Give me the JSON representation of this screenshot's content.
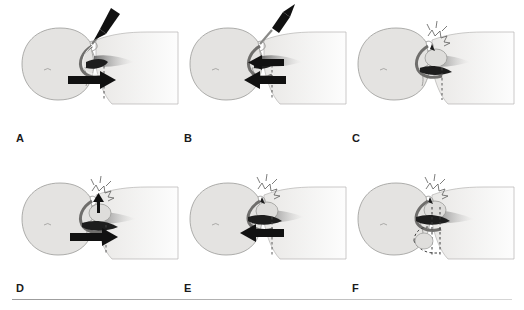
{
  "figure": {
    "type": "medical-illustration",
    "background_color": "#ffffff",
    "panel_count": 6,
    "layout": "2 rows x 3 columns",
    "view": "sagittal section of head and neck, supine patient facing left",
    "has_bottom_rule": true,
    "rule_color": "#a8a8a8"
  },
  "colors": {
    "skin_fill": "#e4e3e1",
    "skin_outline": "#9a9a98",
    "airway_dark": "#1d1d1d",
    "arrow_black": "#111111",
    "shadow_gray": "#8d8d8d",
    "dashed_line": "#4a4a4a",
    "label_text": "#1a1a1a"
  },
  "panels": [
    {
      "id": "A",
      "label": "A",
      "row": 1,
      "column": 1,
      "arrows": [
        {
          "name": "syringe-insertion-arrow",
          "direction": "down-left",
          "style": "solid-black-thick"
        },
        {
          "name": "anterior-displacement-arrow",
          "direction": "right",
          "style": "solid-black-thick"
        }
      ],
      "instruments": [
        "syringe"
      ],
      "dashed_marker": "vertical-reference-line",
      "mask_inflated": false
    },
    {
      "id": "B",
      "label": "B",
      "row": 1,
      "column": 2,
      "arrows": [
        {
          "name": "syringe-withdrawal-arrow",
          "direction": "up-right",
          "style": "solid-black-thick"
        },
        {
          "name": "airway-recoil-arrow-upper",
          "direction": "left",
          "style": "solid-black-thick"
        },
        {
          "name": "airway-recoil-arrow-lower",
          "direction": "left",
          "style": "solid-black-thick"
        }
      ],
      "instruments": [
        "syringe"
      ],
      "dashed_marker": "vertical-reference-line",
      "mask_inflated": false
    },
    {
      "id": "C",
      "label": "C",
      "row": 1,
      "column": 3,
      "arrows": [],
      "instruments": [],
      "dashed_marker": "vertical-reference-line",
      "mask_inflated": true
    },
    {
      "id": "D",
      "label": "D",
      "row": 2,
      "column": 1,
      "arrows": [
        {
          "name": "cuff-pressure-arrow",
          "direction": "up",
          "style": "solid-black-thin"
        },
        {
          "name": "anterior-displacement-arrow",
          "direction": "right",
          "style": "solid-black-thick"
        }
      ],
      "instruments": [],
      "dashed_marker": "vertical-reference-line",
      "mask_inflated": true
    },
    {
      "id": "E",
      "label": "E",
      "row": 2,
      "column": 2,
      "arrows": [
        {
          "name": "posterior-recoil-arrow",
          "direction": "left",
          "style": "solid-black-thick"
        }
      ],
      "instruments": [],
      "dashed_marker": "vertical-reference-line",
      "mask_inflated": true
    },
    {
      "id": "F",
      "label": "F",
      "row": 2,
      "column": 3,
      "arrows": [],
      "instruments": [],
      "dashed_marker": "dashed-displacement-outline",
      "mask_inflated": true
    }
  ]
}
